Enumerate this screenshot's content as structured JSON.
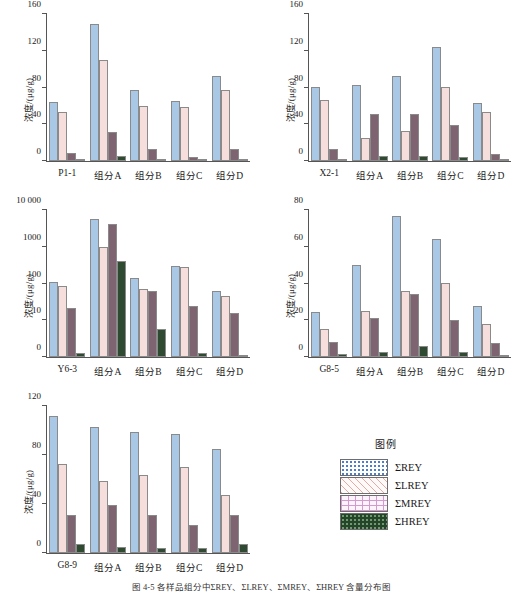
{
  "figure": {
    "caption": "图 4-5  各样品组分中ΣREY、ΣLREY、ΣMREY、ΣHREY 含量分布图"
  },
  "axis": {
    "ylabel": "浓度/(μg/g)"
  },
  "legend": {
    "title": "图例",
    "items": [
      {
        "name": "ΣREY",
        "swatch": "blue-dotted-swatch"
      },
      {
        "name": "ΣLREY",
        "swatch": "pink-diagonal-swatch"
      },
      {
        "name": "ΣMREY",
        "swatch": "pink-grid-swatch"
      },
      {
        "name": "ΣHREY",
        "swatch": "green-dotted-swatch"
      }
    ]
  },
  "colors": {
    "series_rey": "#a9c8e6",
    "series_lrey": "#f6dedc",
    "series_mrey": "#7d6470",
    "series_hrey": "#2e4a30",
    "axis": "#555555",
    "background": "#ffffff"
  },
  "chart_data": [
    {
      "id": "p1-1",
      "type": "bar",
      "title": "",
      "xlabel": "",
      "ylabel": "浓度/(μg/g)",
      "scale": "linear",
      "ylim": [
        0,
        160
      ],
      "yticks": [
        0,
        40,
        80,
        120,
        160
      ],
      "ytick_labels": [
        "0",
        "40",
        "80",
        "120",
        "160"
      ],
      "grid": false,
      "legend_position": "external",
      "categories": [
        "P1-1",
        "组分A",
        "组分B",
        "组分C",
        "组分D"
      ],
      "series": [
        {
          "name": "ΣREY",
          "values": [
            64,
            149,
            77,
            65,
            93
          ]
        },
        {
          "name": "ΣLREY",
          "values": [
            53,
            110,
            60,
            59,
            77
          ]
        },
        {
          "name": "ΣMREY",
          "values": [
            9,
            32,
            13,
            4,
            13
          ]
        },
        {
          "name": "ΣHREY",
          "values": [
            1,
            6,
            2,
            0.5,
            2
          ]
        }
      ]
    },
    {
      "id": "x2-1",
      "type": "bar",
      "title": "",
      "xlabel": "",
      "ylabel": "浓度/(μg/g)",
      "scale": "linear",
      "ylim": [
        0,
        160
      ],
      "yticks": [
        0,
        40,
        80,
        120,
        160
      ],
      "ytick_labels": [
        "0",
        "40",
        "80",
        "120",
        "160"
      ],
      "grid": false,
      "legend_position": "external",
      "categories": [
        "X2-1",
        "组分A",
        "组分B",
        "组分C",
        "组分D"
      ],
      "series": [
        {
          "name": "ΣREY",
          "values": [
            81,
            83,
            92,
            124,
            63
          ]
        },
        {
          "name": "ΣLREY",
          "values": [
            66,
            25,
            33,
            81,
            53
          ]
        },
        {
          "name": "ΣMREY",
          "values": [
            13,
            51,
            51,
            39,
            8
          ]
        },
        {
          "name": "ΣHREY",
          "values": [
            2,
            6,
            6,
            4,
            1
          ]
        }
      ]
    },
    {
      "id": "y6-3",
      "type": "bar",
      "title": "",
      "xlabel": "",
      "ylabel": "浓度/(μg/g)",
      "scale": "log",
      "ylim": [
        0,
        10000
      ],
      "yticks": [
        0,
        10,
        100,
        1000,
        10000
      ],
      "ytick_labels": [
        "0",
        "10",
        "100",
        "1000",
        "10 000"
      ],
      "grid": false,
      "legend_position": "external",
      "categories": [
        "Y6-3",
        "组分A",
        "组分B",
        "组分C",
        "组分D"
      ],
      "series": [
        {
          "name": "ΣREY",
          "values": [
            110,
            5600,
            140,
            300,
            63
          ]
        },
        {
          "name": "ΣLREY",
          "values": [
            88,
            1000,
            70,
            280,
            45
          ]
        },
        {
          "name": "ΣMREY",
          "values": [
            22,
            4100,
            64,
            24,
            16
          ]
        },
        {
          "name": "ΣHREY",
          "values": [
            1,
            410,
            7.5,
            1,
            0
          ]
        }
      ]
    },
    {
      "id": "g8-5",
      "type": "bar",
      "title": "",
      "xlabel": "",
      "ylabel": "浓度/(μg/g)",
      "scale": "linear",
      "ylim": [
        0,
        80
      ],
      "yticks": [
        0,
        20,
        40,
        60,
        80
      ],
      "ytick_labels": [
        "0",
        "20",
        "40",
        "60",
        "80"
      ],
      "grid": false,
      "legend_position": "external",
      "categories": [
        "G8-5",
        "组分A",
        "组分B",
        "组分C",
        "组分D"
      ],
      "series": [
        {
          "name": "ΣREY",
          "values": [
            24.5,
            50,
            77,
            64,
            27.5
          ]
        },
        {
          "name": "ΣLREY",
          "values": [
            15,
            25,
            36,
            40.5,
            18
          ]
        },
        {
          "name": "ΣMREY",
          "values": [
            8,
            21.5,
            34.5,
            20,
            7.5
          ]
        },
        {
          "name": "ΣHREY",
          "values": [
            1.5,
            3,
            6,
            3,
            1
          ]
        }
      ]
    },
    {
      "id": "g8-9",
      "type": "bar",
      "title": "",
      "xlabel": "",
      "ylabel": "浓度/(μg/g)",
      "scale": "linear",
      "ylim": [
        0,
        120
      ],
      "yticks": [
        0,
        40,
        80,
        120
      ],
      "ytick_labels": [
        "0",
        "40",
        "80",
        "120"
      ],
      "grid": false,
      "legend_position": "external",
      "categories": [
        "G8-9",
        "组分A",
        "组分B",
        "组分C",
        "组分D"
      ],
      "series": [
        {
          "name": "ΣREY",
          "values": [
            112,
            103,
            99,
            97,
            85
          ]
        },
        {
          "name": "ΣLREY",
          "values": [
            73,
            59,
            64,
            70,
            47
          ]
        },
        {
          "name": "ΣMREY",
          "values": [
            31,
            39,
            31,
            23,
            31
          ]
        },
        {
          "name": "ΣHREY",
          "values": [
            7,
            5,
            4,
            4,
            7
          ]
        }
      ]
    }
  ]
}
